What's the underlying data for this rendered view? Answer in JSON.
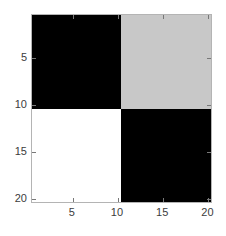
{
  "figure": {
    "background_color": "#ffffff",
    "axes_line_color": "#b4b4b4",
    "tick_color": "#787878",
    "tick_label_color": "#3c3c3c"
  },
  "chart_data": {
    "type": "heatmap",
    "title": "",
    "xlabel": "",
    "ylabel": "",
    "xlim": [
      0.5,
      20.5
    ],
    "ylim": [
      0.5,
      20.5
    ],
    "y_axis_direction": "reverse",
    "grid": false,
    "legend": "none",
    "colorbar": false,
    "colormap": "gray",
    "xticks": [
      5,
      10,
      15,
      20
    ],
    "xticklabels": [
      "5",
      "10",
      "15",
      "20"
    ],
    "yticks": [
      5,
      10,
      15,
      20
    ],
    "yticklabels": [
      "5",
      "10",
      "15",
      "20"
    ],
    "block_structure": {
      "rows": [
        {
          "range": [
            1,
            10
          ],
          "blocks": [
            {
              "name": "top-left",
              "cols": [
                1,
                10
              ],
              "value": 0,
              "color": "#000000"
            },
            {
              "name": "top-right",
              "cols": [
                11,
                20
              ],
              "value": 0.78,
              "color": "#c8c8c8"
            }
          ]
        },
        {
          "range": [
            11,
            20
          ],
          "blocks": [
            {
              "name": "bottom-left",
              "cols": [
                1,
                10
              ],
              "value": 1,
              "color": "#ffffff"
            },
            {
              "name": "bottom-right",
              "cols": [
                11,
                20
              ],
              "value": 0,
              "color": "#000000"
            }
          ]
        }
      ]
    },
    "quadrants": [
      {
        "id": "top-left",
        "color": "#000000",
        "value": 0
      },
      {
        "id": "top-right",
        "color": "#c8c8c8",
        "value": 0.78
      },
      {
        "id": "bottom-left",
        "color": "#ffffff",
        "value": 1
      },
      {
        "id": "bottom-right",
        "color": "#000000",
        "value": 0
      }
    ],
    "values_unique": [
      0,
      0.78,
      1
    ],
    "matrix_size": [
      20,
      20
    ]
  }
}
